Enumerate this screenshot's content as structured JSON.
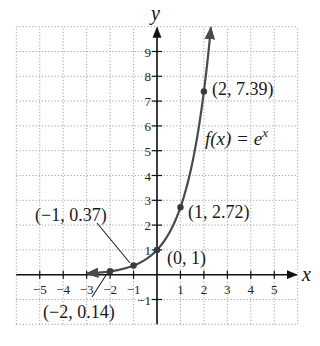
{
  "chart_data": {
    "type": "line",
    "title": "",
    "function_label": "f(x) = e^x",
    "function_label_parts": {
      "lhs": "f(x) = e",
      "exp": "x"
    },
    "xlabel": "x",
    "ylabel": "y",
    "xlim": [
      -6,
      6
    ],
    "ylim": [
      -2,
      10
    ],
    "grid": true,
    "x_ticks": [
      -5,
      -4,
      -3,
      -2,
      -1,
      1,
      2,
      3,
      4,
      5
    ],
    "x_tick_labels": [
      "−5",
      "−4",
      "−3",
      "−2",
      "−1",
      "1",
      "2",
      "3",
      "4",
      "5"
    ],
    "y_ticks": [
      -1,
      1,
      2,
      3,
      4,
      5,
      6,
      7,
      8,
      9
    ],
    "y_tick_labels": [
      "−1",
      "1",
      "2",
      "3",
      "4",
      "5",
      "6",
      "7",
      "8",
      "9"
    ],
    "series": [
      {
        "name": "f(x) = e^x",
        "x_range": [
          -3,
          2.3
        ],
        "x": [
          -3,
          -2.5,
          -2,
          -1.5,
          -1,
          -0.5,
          0,
          0.5,
          1,
          1.5,
          2,
          2.3
        ],
        "y": [
          0.05,
          0.08,
          0.14,
          0.22,
          0.37,
          0.61,
          1,
          1.65,
          2.72,
          4.48,
          7.39,
          9.97
        ],
        "color": "#4a4a4a"
      }
    ],
    "labeled_points": [
      {
        "x": -2,
        "y": 0.14,
        "label": "(−2, 0.14)"
      },
      {
        "x": -1,
        "y": 0.37,
        "label": "(−1, 0.37)"
      },
      {
        "x": 0,
        "y": 1,
        "label": "(0, 1)"
      },
      {
        "x": 1,
        "y": 2.72,
        "label": "(1, 2.72)"
      },
      {
        "x": 2,
        "y": 7.39,
        "label": "(2, 7.39)"
      }
    ]
  },
  "colors": {
    "axis": "#111111",
    "grid": "#9a9a9a",
    "curve": "#4a4a4a",
    "point": "#3a3a3a"
  }
}
